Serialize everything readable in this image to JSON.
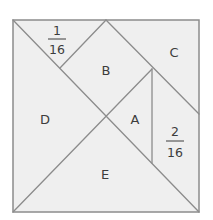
{
  "diagram": {
    "type": "tangram-square",
    "colors": {
      "fill": "#efefef",
      "line": "#8c8c8c",
      "text": "#3c3c3c",
      "background": "#ffffff"
    },
    "pieces": [
      {
        "id": "top-left-small",
        "label_numerator": "1",
        "label_denominator": "16"
      },
      {
        "id": "B",
        "label": "B"
      },
      {
        "id": "C",
        "label": "C"
      },
      {
        "id": "D",
        "label": "D"
      },
      {
        "id": "A",
        "label": "A"
      },
      {
        "id": "right-mid",
        "label_numerator": "2",
        "label_denominator": "16"
      },
      {
        "id": "E",
        "label": "E"
      }
    ]
  }
}
